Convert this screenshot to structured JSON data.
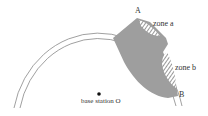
{
  "diagram": {
    "type": "coverage-zone-diagram",
    "labels": {
      "point_a": "A",
      "point_b": "B",
      "zone_a": "zone a",
      "zone_b": "zone b",
      "base_station": "base station O"
    },
    "colors": {
      "arc": "#888888",
      "shaded_region": "#9e9e9e",
      "hatch": "#444444",
      "dot": "#111111"
    }
  }
}
